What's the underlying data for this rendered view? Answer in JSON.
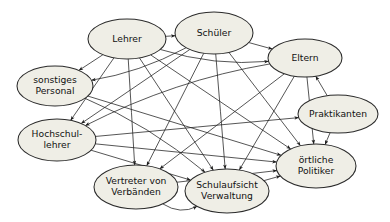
{
  "diagram": {
    "background_color": "#ffffff",
    "node_fill_color": "#efeee6",
    "node_stroke_color": "#2b2b2b",
    "edge_color": "#1d1d1d",
    "text_color": "#111111",
    "arrow_style": "double-headed",
    "nodes": [
      {
        "id": "lehrer",
        "label": "Lehrer",
        "lines": [
          "Lehrer"
        ],
        "cx": 127,
        "cy": 39,
        "rx": 39,
        "ry": 20
      },
      {
        "id": "schueler",
        "label": "Schüler",
        "lines": [
          "Schüler"
        ],
        "cx": 214,
        "cy": 33,
        "rx": 39,
        "ry": 21
      },
      {
        "id": "eltern",
        "label": "Eltern",
        "lines": [
          "Eltern"
        ],
        "cx": 305,
        "cy": 58,
        "rx": 37,
        "ry": 19
      },
      {
        "id": "sonstiges-personal",
        "label": "sonstiges Personal",
        "lines": [
          "sonstiges",
          "Personal"
        ],
        "cx": 55,
        "cy": 86,
        "rx": 38,
        "ry": 20
      },
      {
        "id": "praktikanten",
        "label": "Praktikanten",
        "lines": [
          "Praktikanten"
        ],
        "cx": 338,
        "cy": 114,
        "rx": 40,
        "ry": 19
      },
      {
        "id": "hochschullehrer",
        "label": "Hochschul-lehrer",
        "lines": [
          "Hochschul-",
          "lehrer"
        ],
        "cx": 57,
        "cy": 140,
        "rx": 39,
        "ry": 21
      },
      {
        "id": "vertreter-verbaende",
        "label": "Vertreter von Verbänden",
        "lines": [
          "Vertreter von",
          "Verbänden"
        ],
        "cx": 136,
        "cy": 187,
        "rx": 42,
        "ry": 22
      },
      {
        "id": "schulaufsicht",
        "label": "Schulaufsicht Verwaltung",
        "lines": [
          "Schulaufsicht",
          "Verwaltung"
        ],
        "cx": 227,
        "cy": 191,
        "rx": 42,
        "ry": 22
      },
      {
        "id": "oertliche-politiker",
        "label": "örtliche Politiker",
        "lines": [
          "örtliche",
          "Politiker"
        ],
        "cx": 316,
        "cy": 166,
        "rx": 40,
        "ry": 22
      }
    ],
    "edges": [
      {
        "from": "lehrer",
        "to": "schueler",
        "curve": 0
      },
      {
        "from": "lehrer",
        "to": "eltern",
        "curve": 18
      },
      {
        "from": "lehrer",
        "to": "sonstiges-personal",
        "curve": 0
      },
      {
        "from": "lehrer",
        "to": "hochschullehrer",
        "curve": 0
      },
      {
        "from": "lehrer",
        "to": "vertreter-verbaende",
        "curve": 0
      },
      {
        "from": "lehrer",
        "to": "schulaufsicht",
        "curve": 0
      },
      {
        "from": "lehrer",
        "to": "oertliche-politiker",
        "curve": 0
      },
      {
        "from": "schueler",
        "to": "eltern",
        "curve": 0
      },
      {
        "from": "schueler",
        "to": "sonstiges-personal",
        "curve": -14
      },
      {
        "from": "schueler",
        "to": "hochschullehrer",
        "curve": 0
      },
      {
        "from": "schueler",
        "to": "vertreter-verbaende",
        "curve": 0
      },
      {
        "from": "schueler",
        "to": "schulaufsicht",
        "curve": 0
      },
      {
        "from": "schueler",
        "to": "oertliche-politiker",
        "curve": 0
      },
      {
        "from": "eltern",
        "to": "hochschullehrer",
        "curve": 20
      },
      {
        "from": "eltern",
        "to": "vertreter-verbaende",
        "curve": 0
      },
      {
        "from": "eltern",
        "to": "schulaufsicht",
        "curve": 0
      },
      {
        "from": "eltern",
        "to": "oertliche-politiker",
        "curve": 0
      },
      {
        "from": "sonstiges-personal",
        "to": "schulaufsicht",
        "curve": -16
      },
      {
        "from": "sonstiges-personal",
        "to": "oertliche-politiker",
        "curve": 0
      },
      {
        "from": "hochschullehrer",
        "to": "schulaufsicht",
        "curve": 0
      },
      {
        "from": "hochschullehrer",
        "to": "oertliche-politiker",
        "curve": 0
      },
      {
        "from": "hochschullehrer",
        "to": "praktikanten",
        "curve": 0
      },
      {
        "from": "vertreter-verbaende",
        "to": "oertliche-politiker",
        "curve": 0
      },
      {
        "from": "vertreter-verbaende",
        "to": "schulaufsicht",
        "curve": 26
      },
      {
        "from": "schulaufsicht",
        "to": "oertliche-politiker",
        "curve": 0
      },
      {
        "from": "praktikanten",
        "to": "eltern",
        "curve": 0
      },
      {
        "from": "praktikanten",
        "to": "oertliche-politiker",
        "curve": 0
      }
    ]
  }
}
